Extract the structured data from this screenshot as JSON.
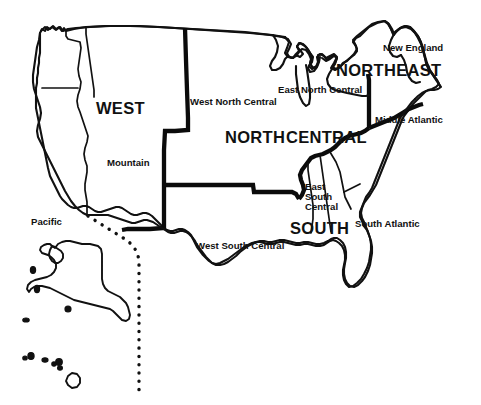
{
  "map": {
    "title": "United States Census Regions and Divisions",
    "background_color": "#ffffff",
    "line_color": "#111111",
    "width": 481,
    "height": 405,
    "regions": [
      {
        "key": "west",
        "label": "WEST",
        "type": "region",
        "x": 96,
        "y": 100
      },
      {
        "key": "north_central",
        "label_part1": "NORTH",
        "label_part2": "CENTRAL",
        "type": "region",
        "x": 225,
        "y": 129
      },
      {
        "key": "northeast",
        "label": "NORTHEAST",
        "type": "region",
        "x": 336,
        "y": 62
      },
      {
        "key": "south",
        "label": "SOUTH",
        "type": "region",
        "x": 290,
        "y": 220
      }
    ],
    "divisions": [
      {
        "key": "pacific",
        "label": "Pacific",
        "type": "division",
        "x": 31,
        "y": 217
      },
      {
        "key": "mountain",
        "label": "Mountain",
        "type": "division",
        "x": 107,
        "y": 158
      },
      {
        "key": "west_north_central",
        "label": "West North Central",
        "type": "division",
        "x": 190,
        "y": 97
      },
      {
        "key": "east_north_central",
        "label": "East North Central",
        "type": "division",
        "x": 278,
        "y": 85
      },
      {
        "key": "new_england",
        "label": "New England",
        "type": "division",
        "x": 383,
        "y": 43
      },
      {
        "key": "middle_atlantic",
        "label": "Middle Atlantic",
        "type": "division",
        "x": 375,
        "y": 115
      },
      {
        "key": "west_south_central",
        "label": "West South Central",
        "type": "division",
        "x": 196,
        "y": 241
      },
      {
        "key": "east_south_central",
        "label_lines": [
          "East",
          "South",
          "Central"
        ],
        "type": "division",
        "x": 305,
        "y": 182
      },
      {
        "key": "south_atlantic",
        "label": "South Atlantic",
        "type": "division",
        "x": 355,
        "y": 219
      }
    ],
    "features": [
      {
        "key": "contiguous-us",
        "label": "Contiguous United States outline"
      },
      {
        "key": "alaska",
        "label": "Alaska outline"
      },
      {
        "key": "hawaii",
        "label": "Hawaii islands"
      },
      {
        "key": "dotted-divider",
        "label": "Dotted inset divider line"
      }
    ]
  }
}
